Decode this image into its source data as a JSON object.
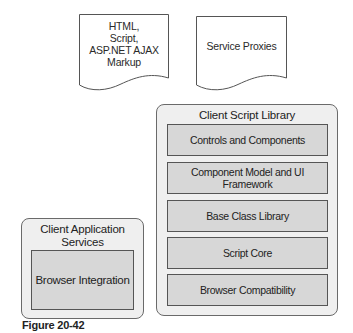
{
  "documents": [
    {
      "label_lines": [
        "HTML,",
        "Script,",
        "ASP.NET AJAX",
        "Markup"
      ]
    },
    {
      "label": "Service Proxies"
    }
  ],
  "client_script_library": {
    "title": "Client Script Library",
    "layers": [
      "Controls and Components",
      "Component Model and UI Framework",
      "Base Class Library",
      "Script Core",
      "Browser Compatibility"
    ]
  },
  "client_application_services": {
    "title_lines": [
      "Client Application",
      "Services"
    ],
    "layers": [
      "Browser Integration"
    ]
  },
  "caption": "Figure 20-42",
  "colors": {
    "outer_fill": "#efefef",
    "inner_fill": "#d7d7d7",
    "border": "#555555"
  }
}
